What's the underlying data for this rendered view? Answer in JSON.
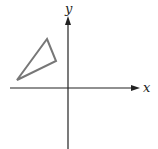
{
  "diagram": {
    "type": "coordinate-plane",
    "x_axis_label": "x",
    "y_axis_label": "y",
    "axis_color": "#222222",
    "shape_color": "#777777",
    "shape": {
      "kind": "triangle",
      "quadrant": "II",
      "vertices_px": [
        [
          47,
          39
        ],
        [
          56,
          61
        ],
        [
          17,
          80
        ]
      ]
    }
  }
}
